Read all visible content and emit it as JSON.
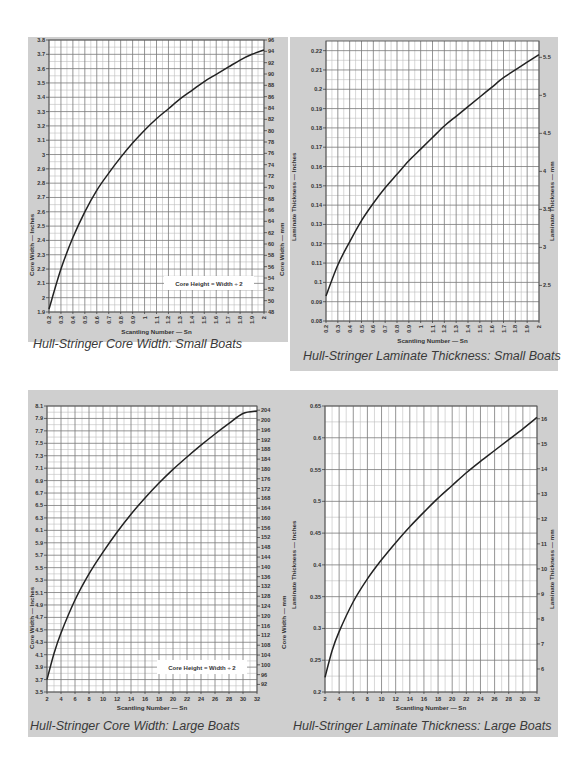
{
  "page": {
    "background": "#ffffff",
    "panel_color": "#cfcfcf",
    "grid_major": "#7a7a7a",
    "grid_minor": "#bdbdbd",
    "curve_color": "#222222"
  },
  "chart_data": [
    {
      "id": "core-width-small",
      "type": "line",
      "title": "Hull-Stringer Core Width: Small Boats",
      "xlabel": "Scantling Number — Sn",
      "ylabel": "Core Width — Inches",
      "y2label": "Core Width — mm",
      "xlim": [
        0.2,
        2.0
      ],
      "ylim": [
        1.9,
        3.8
      ],
      "y2lim": [
        48,
        96
      ],
      "x_ticks": [
        "0.2",
        "0.3",
        "0.4",
        "0.5",
        "0.6",
        "0.7",
        "0.8",
        "0.9",
        "1",
        "1.1",
        "1.2",
        "1.3",
        "1.4",
        "1.5",
        "1.6",
        "1.7",
        "1.8",
        "1.9",
        "2"
      ],
      "y_ticks": [
        "1.9",
        "2",
        "2.1",
        "2.2",
        "2.3",
        "2.4",
        "2.5",
        "2.6",
        "2.7",
        "2.8",
        "2.9",
        "3",
        "3.1",
        "3.2",
        "3.3",
        "3.4",
        "3.5",
        "3.6",
        "3.7",
        "3.8"
      ],
      "y2_ticks": [
        "48",
        "50",
        "52",
        "54",
        "56",
        "58",
        "60",
        "62",
        "64",
        "66",
        "68",
        "70",
        "72",
        "74",
        "76",
        "78",
        "80",
        "82",
        "84",
        "86",
        "88",
        "90",
        "92",
        "94",
        "96"
      ],
      "annotation": "Core Height = Width ÷ 2",
      "grid": true,
      "x_tick_rotation": -90,
      "series": [
        {
          "name": "Core Width",
          "x": [
            0.2,
            0.3,
            0.4,
            0.5,
            0.6,
            0.7,
            0.8,
            0.9,
            1.0,
            1.1,
            1.2,
            1.3,
            1.4,
            1.5,
            1.6,
            1.7,
            1.8,
            1.9,
            2.0
          ],
          "y": [
            1.92,
            2.2,
            2.42,
            2.6,
            2.75,
            2.87,
            2.98,
            3.08,
            3.17,
            3.25,
            3.32,
            3.39,
            3.45,
            3.51,
            3.56,
            3.61,
            3.66,
            3.7,
            3.73
          ]
        }
      ]
    },
    {
      "id": "laminate-small",
      "type": "line",
      "title": "Hull-Stringer Laminate Thickness: Small Boats",
      "xlabel": "Scantling Number — Sn",
      "ylabel": "Laminate Thickness — Inches",
      "y2label": "Laminate Thickness — mm",
      "xlim": [
        0.2,
        2.0
      ],
      "ylim": [
        0.08,
        0.225
      ],
      "y2lim": [
        2.032,
        5.715
      ],
      "x_ticks": [
        "0.2",
        "0.3",
        "0.4",
        "0.5",
        "0.6",
        "0.7",
        "0.8",
        "0.9",
        "1",
        "1.1",
        "1.2",
        "1.3",
        "1.4",
        "1.5",
        "1.6",
        "1.7",
        "1.8",
        "1.9",
        "2"
      ],
      "y_ticks": [
        "0.08",
        "0.09",
        "0.1",
        "0.11",
        "0.12",
        "0.13",
        "0.14",
        "0.15",
        "0.16",
        "0.17",
        "0.18",
        "0.19",
        "0.2",
        "0.21",
        "0.22"
      ],
      "y2_ticks": [
        "2",
        "2.5",
        "3",
        "3.5",
        "4",
        "4.5",
        "5",
        "5.5"
      ],
      "grid": true,
      "x_tick_rotation": -90,
      "series": [
        {
          "name": "Laminate Thickness",
          "x": [
            0.2,
            0.3,
            0.4,
            0.5,
            0.6,
            0.7,
            0.8,
            0.9,
            1.0,
            1.1,
            1.2,
            1.3,
            1.4,
            1.5,
            1.6,
            1.7,
            1.8,
            1.9,
            2.0
          ],
          "y": [
            0.093,
            0.109,
            0.121,
            0.132,
            0.141,
            0.149,
            0.156,
            0.163,
            0.169,
            0.175,
            0.181,
            0.186,
            0.191,
            0.196,
            0.201,
            0.206,
            0.21,
            0.214,
            0.218
          ]
        }
      ]
    },
    {
      "id": "core-width-large",
      "type": "line",
      "title": "Hull-Stringer Core Width: Large Boats",
      "xlabel": "Scantling Number — Sn",
      "ylabel": "Core Width — Inches",
      "y2label": "Core Width — mm",
      "xlim": [
        2,
        32
      ],
      "ylim": [
        3.5,
        8.1
      ],
      "y2lim": [
        88.9,
        205.7
      ],
      "x_ticks": [
        "2",
        "4",
        "6",
        "8",
        "10",
        "12",
        "14",
        "16",
        "18",
        "20",
        "22",
        "24",
        "26",
        "28",
        "30",
        "32"
      ],
      "y_ticks": [
        "3.5",
        "3.7",
        "3.9",
        "4.1",
        "4.3",
        "4.5",
        "4.7",
        "4.9",
        "5.1",
        "5.3",
        "5.5",
        "5.7",
        "5.9",
        "6.1",
        "6.3",
        "6.5",
        "6.7",
        "6.9",
        "7.1",
        "7.3",
        "7.5",
        "7.7",
        "7.9",
        "8.1"
      ],
      "y2_ticks": [
        "88",
        "92",
        "96",
        "100",
        "104",
        "108",
        "112",
        "116",
        "120",
        "124",
        "128",
        "132",
        "136",
        "140",
        "144",
        "148",
        "152",
        "156",
        "160",
        "164",
        "168",
        "172",
        "176",
        "180",
        "184",
        "188",
        "192",
        "196",
        "200",
        "204"
      ],
      "annotation": "Core Height = Width ÷ 2",
      "grid": true,
      "x_tick_rotation": 0,
      "series": [
        {
          "name": "Core Width",
          "x": [
            2,
            3,
            4,
            6,
            8,
            10,
            12,
            14,
            16,
            18,
            20,
            22,
            24,
            26,
            28,
            30,
            32
          ],
          "y": [
            3.7,
            4.12,
            4.45,
            4.98,
            5.4,
            5.75,
            6.07,
            6.36,
            6.62,
            6.86,
            7.08,
            7.28,
            7.47,
            7.65,
            7.82,
            7.98,
            8.02
          ]
        }
      ]
    },
    {
      "id": "laminate-large",
      "type": "line",
      "title": "Hull-Stringer Laminate Thickness: Large Boats",
      "xlabel": "Scantling Number — Sn",
      "ylabel": "Laminate Thickness — Inches",
      "y2label": "Laminate Thickness — mm",
      "xlim": [
        2,
        32
      ],
      "ylim": [
        0.2,
        0.65
      ],
      "y2lim": [
        5.08,
        16.51
      ],
      "x_ticks": [
        "2",
        "4",
        "6",
        "8",
        "10",
        "12",
        "14",
        "16",
        "18",
        "20",
        "22",
        "24",
        "26",
        "28",
        "30",
        "32"
      ],
      "y_ticks": [
        "0.2",
        "0.25",
        "0.3",
        "0.35",
        "0.4",
        "0.45",
        "0.5",
        "0.55",
        "0.6",
        "0.65"
      ],
      "y2_ticks": [
        "5",
        "6",
        "7",
        "8",
        "9",
        "10",
        "11",
        "12",
        "13",
        "14",
        "15",
        "16"
      ],
      "grid": true,
      "x_tick_rotation": 0,
      "series": [
        {
          "name": "Laminate Thickness",
          "x": [
            2,
            3,
            4,
            6,
            8,
            10,
            12,
            14,
            16,
            18,
            20,
            22,
            24,
            26,
            28,
            30,
            32
          ],
          "y": [
            0.223,
            0.265,
            0.295,
            0.342,
            0.378,
            0.408,
            0.435,
            0.46,
            0.483,
            0.505,
            0.525,
            0.545,
            0.563,
            0.58,
            0.597,
            0.614,
            0.632
          ]
        }
      ]
    }
  ],
  "layout": [
    {
      "panel": [
        28,
        37,
        260,
        305
      ],
      "plot": [
        49,
        40,
        264,
        312
      ],
      "caption_pos": [
        33,
        345
      ]
    },
    {
      "panel": [
        290,
        37,
        268,
        334
      ],
      "plot": [
        326,
        41,
        539,
        321
      ],
      "caption_pos": [
        303,
        357
      ]
    },
    {
      "panel": [
        28,
        390,
        262,
        347
      ],
      "plot": [
        47,
        406,
        257,
        692
      ],
      "caption_pos": [
        30,
        727
      ]
    },
    {
      "panel": [
        290,
        390,
        268,
        347
      ],
      "plot": [
        325,
        406,
        537,
        692
      ],
      "caption_pos": [
        293,
        727
      ]
    }
  ]
}
